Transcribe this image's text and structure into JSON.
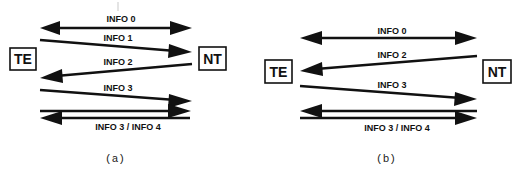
{
  "panels": [
    {
      "caption": "(a)",
      "left_node": "TE",
      "right_node": "NT",
      "signals": [
        {
          "label": "INFO 0",
          "direction": "both"
        },
        {
          "label": "INFO 1",
          "direction": "TE-to-NT"
        },
        {
          "label": "INFO 2",
          "direction": "NT-to-TE"
        },
        {
          "label": "INFO 3",
          "direction": "TE-to-NT"
        },
        {
          "label": "INFO 3 / INFO 4",
          "direction": "TE-to-NT over NT-to-TE"
        }
      ]
    },
    {
      "caption": "(b)",
      "left_node": "TE",
      "right_node": "NT",
      "signals": [
        {
          "label": "INFO 0",
          "direction": "both"
        },
        {
          "label": "INFO 2",
          "direction": "NT-to-TE"
        },
        {
          "label": "INFO 3",
          "direction": "TE-to-NT"
        },
        {
          "label": "INFO 3 / INFO 4",
          "direction": "NT-to-TE over TE-to-NT"
        }
      ]
    }
  ],
  "colors": {
    "ink": "#111111",
    "background": "#ffffff"
  }
}
